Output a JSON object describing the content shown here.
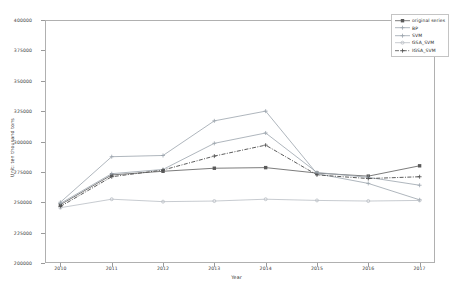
{
  "chart_data": {
    "type": "line",
    "title": "",
    "xlabel": "Year",
    "ylabel": "Unit: ten thousand tons",
    "x": [
      2010,
      2011,
      2012,
      2013,
      2014,
      2015,
      2016,
      2017
    ],
    "xticklabels": [
      "2010",
      "2011",
      "2012",
      "2013",
      "2014",
      "2015",
      "2016",
      "2017"
    ],
    "yticklabels": [
      "200000",
      "225000",
      "250000",
      "275000",
      "300000",
      "325000",
      "350000",
      "375000",
      "400000"
    ],
    "yticks": [
      200000,
      225000,
      250000,
      275000,
      300000,
      325000,
      350000,
      375000,
      400000
    ],
    "xlim": [
      2009.7,
      2017.3
    ],
    "ylim": [
      200000,
      400000
    ],
    "grid": false,
    "legend_position": "upper right",
    "series": [
      {
        "name": "original series",
        "color": "#5a5a5a",
        "marker": "square",
        "linestyle": "solid",
        "values": [
          248000,
          272500,
          275500,
          278000,
          278500,
          274000,
          271500,
          280000
        ]
      },
      {
        "name": "BP",
        "color": "#9aa3ac",
        "marker": "plus",
        "linestyle": "solid",
        "values": [
          250000,
          287500,
          288500,
          317000,
          325000,
          273500,
          265500,
          252000
        ]
      },
      {
        "name": "SVM",
        "color": "#9aa3ac",
        "marker": "plus",
        "linestyle": "solid",
        "values": [
          249000,
          273500,
          277000,
          298500,
          307000,
          274500,
          270500,
          264000
        ]
      },
      {
        "name": "GSA_SVM",
        "color": "#b9bec4",
        "marker": "circle",
        "linestyle": "solid",
        "values": [
          245500,
          252500,
          250500,
          251000,
          252500,
          251500,
          251000,
          251500
        ]
      },
      {
        "name": "IGSA_SVM",
        "color": "#4a4a4a",
        "marker": "plus",
        "linestyle": "dashdot",
        "values": [
          246500,
          271000,
          276500,
          288000,
          297000,
          272500,
          269500,
          271000
        ]
      }
    ]
  }
}
